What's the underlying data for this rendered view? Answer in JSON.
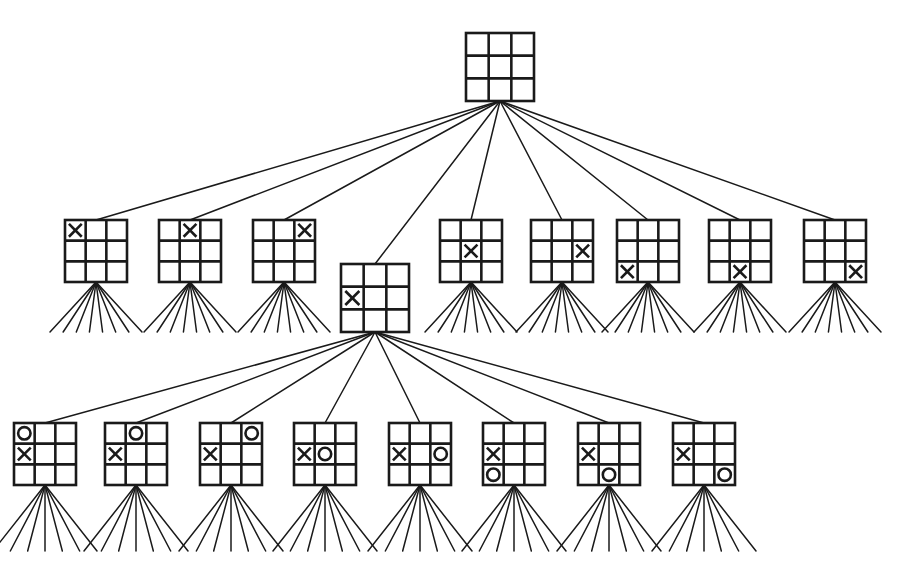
{
  "figure": {
    "background_color": "#ffffff",
    "line_color": "#1a1a1a",
    "mark_color": "#1a1a1a"
  },
  "geometry": {
    "canvas_width": 906,
    "canvas_height": 572,
    "board_size": 62,
    "board_size_small": 68,
    "grid_stroke": 2.6,
    "edge_stroke": 1.5,
    "mark_stroke": 2.6
  },
  "levels": [
    {
      "name": "root",
      "ply": 0,
      "node_count": 1,
      "label": "empty board"
    },
    {
      "name": "ply-1",
      "ply": 1,
      "node_count": 9,
      "label": "X first move, nine options"
    },
    {
      "name": "ply-2",
      "ply": 2,
      "node_count": 8,
      "label": "O reply to X center-left, eight options"
    }
  ],
  "nodes": {
    "root": {
      "id": "root",
      "x": 466,
      "y": 33,
      "size": 68,
      "cells": [
        "",
        "",
        "",
        "",
        "",
        "",
        "",
        "",
        ""
      ],
      "fan": null
    },
    "level1": [
      {
        "id": "L1-0",
        "x": 65,
        "y": 220,
        "size": 62,
        "cells": [
          "X",
          "",
          "",
          "",
          "",
          "",
          "",
          "",
          ""
        ],
        "fan": {
          "count": 8,
          "depth": 50,
          "spread": 46
        }
      },
      {
        "id": "L1-1",
        "x": 159,
        "y": 220,
        "size": 62,
        "cells": [
          "",
          "X",
          "",
          "",
          "",
          "",
          "",
          "",
          ""
        ],
        "fan": {
          "count": 8,
          "depth": 50,
          "spread": 46
        }
      },
      {
        "id": "L1-2",
        "x": 253,
        "y": 220,
        "size": 62,
        "cells": [
          "",
          "",
          "X",
          "",
          "",
          "",
          "",
          "",
          ""
        ],
        "fan": {
          "count": 8,
          "depth": 50,
          "spread": 46
        }
      },
      {
        "id": "L1-3",
        "x": 341,
        "y": 264,
        "size": 68,
        "cells": [
          "",
          "",
          "",
          "X",
          "",
          "",
          "",
          "",
          ""
        ],
        "fan": null
      },
      {
        "id": "L1-4",
        "x": 440,
        "y": 220,
        "size": 62,
        "cells": [
          "",
          "",
          "",
          "",
          "X",
          "",
          "",
          "",
          ""
        ],
        "fan": {
          "count": 8,
          "depth": 50,
          "spread": 46
        }
      },
      {
        "id": "L1-5",
        "x": 531,
        "y": 220,
        "size": 62,
        "cells": [
          "",
          "",
          "",
          "",
          "",
          "X",
          "",
          "",
          ""
        ],
        "fan": {
          "count": 8,
          "depth": 50,
          "spread": 46
        }
      },
      {
        "id": "L1-6",
        "x": 617,
        "y": 220,
        "size": 62,
        "cells": [
          "",
          "",
          "",
          "",
          "",
          "",
          "X",
          "",
          ""
        ],
        "fan": {
          "count": 8,
          "depth": 50,
          "spread": 46
        }
      },
      {
        "id": "L1-7",
        "x": 709,
        "y": 220,
        "size": 62,
        "cells": [
          "",
          "",
          "",
          "",
          "",
          "",
          "",
          "X",
          ""
        ],
        "fan": {
          "count": 8,
          "depth": 50,
          "spread": 46
        }
      },
      {
        "id": "L1-8",
        "x": 804,
        "y": 220,
        "size": 62,
        "cells": [
          "",
          "",
          "",
          "",
          "",
          "",
          "",
          "",
          "X"
        ],
        "fan": {
          "count": 8,
          "depth": 50,
          "spread": 46
        }
      }
    ],
    "level2": [
      {
        "id": "L2-0",
        "x": 14,
        "y": 423,
        "size": 62,
        "cells": [
          "O",
          "",
          "",
          "X",
          "",
          "",
          "",
          "",
          ""
        ],
        "fan": {
          "count": 7,
          "depth": 66,
          "spread": 52
        }
      },
      {
        "id": "L2-1",
        "x": 105,
        "y": 423,
        "size": 62,
        "cells": [
          "",
          "O",
          "",
          "X",
          "",
          "",
          "",
          "",
          ""
        ],
        "fan": {
          "count": 7,
          "depth": 66,
          "spread": 52
        }
      },
      {
        "id": "L2-2",
        "x": 200,
        "y": 423,
        "size": 62,
        "cells": [
          "",
          "",
          "O",
          "X",
          "",
          "",
          "",
          "",
          ""
        ],
        "fan": {
          "count": 7,
          "depth": 66,
          "spread": 52
        }
      },
      {
        "id": "L2-3",
        "x": 294,
        "y": 423,
        "size": 62,
        "cells": [
          "",
          "",
          "",
          "X",
          "O",
          "",
          "",
          "",
          ""
        ],
        "fan": {
          "count": 7,
          "depth": 66,
          "spread": 52
        }
      },
      {
        "id": "L2-4",
        "x": 389,
        "y": 423,
        "size": 62,
        "cells": [
          "",
          "",
          "",
          "X",
          "",
          "O",
          "",
          "",
          ""
        ],
        "fan": {
          "count": 7,
          "depth": 66,
          "spread": 52
        }
      },
      {
        "id": "L2-5",
        "x": 483,
        "y": 423,
        "size": 62,
        "cells": [
          "",
          "",
          "",
          "X",
          "",
          "",
          "O",
          "",
          ""
        ],
        "fan": {
          "count": 7,
          "depth": 66,
          "spread": 52
        }
      },
      {
        "id": "L2-6",
        "x": 578,
        "y": 423,
        "size": 62,
        "cells": [
          "",
          "",
          "",
          "X",
          "",
          "",
          "",
          "O",
          ""
        ],
        "fan": {
          "count": 7,
          "depth": 66,
          "spread": 52
        }
      },
      {
        "id": "L2-7",
        "x": 673,
        "y": 423,
        "size": 62,
        "cells": [
          "",
          "",
          "",
          "X",
          "",
          "",
          "",
          "",
          "O"
        ],
        "fan": {
          "count": 7,
          "depth": 66,
          "spread": 52
        }
      }
    ]
  },
  "edges": [
    {
      "id": "E-root-0",
      "from": "root",
      "to": "L1-0"
    },
    {
      "id": "E-root-1",
      "from": "root",
      "to": "L1-1"
    },
    {
      "id": "E-root-2",
      "from": "root",
      "to": "L1-2"
    },
    {
      "id": "E-root-3",
      "from": "root",
      "to": "L1-3"
    },
    {
      "id": "E-root-4",
      "from": "root",
      "to": "L1-4"
    },
    {
      "id": "E-root-5",
      "from": "root",
      "to": "L1-5"
    },
    {
      "id": "E-root-6",
      "from": "root",
      "to": "L1-6"
    },
    {
      "id": "E-root-7",
      "from": "root",
      "to": "L1-7"
    },
    {
      "id": "E-root-8",
      "from": "root",
      "to": "L1-8"
    },
    {
      "id": "E-L1-3-0",
      "from": "L1-3",
      "to": "L2-0"
    },
    {
      "id": "E-L1-3-1",
      "from": "L1-3",
      "to": "L2-1"
    },
    {
      "id": "E-L1-3-2",
      "from": "L1-3",
      "to": "L2-2"
    },
    {
      "id": "E-L1-3-3",
      "from": "L1-3",
      "to": "L2-3"
    },
    {
      "id": "E-L1-3-4",
      "from": "L1-3",
      "to": "L2-4"
    },
    {
      "id": "E-L1-3-5",
      "from": "L1-3",
      "to": "L2-5"
    },
    {
      "id": "E-L1-3-6",
      "from": "L1-3",
      "to": "L2-6"
    },
    {
      "id": "E-L1-3-7",
      "from": "L1-3",
      "to": "L2-7"
    }
  ]
}
